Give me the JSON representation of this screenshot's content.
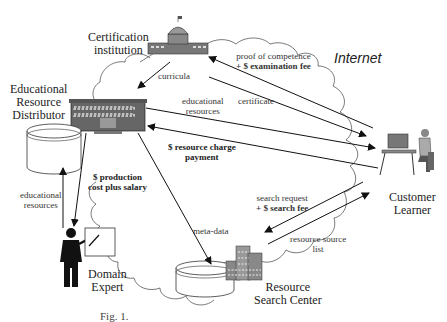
{
  "cloud_label": "Internet",
  "nodes": {
    "certification": {
      "line1": "Certification",
      "line2": "institution"
    },
    "distributor": {
      "line1": "Educational",
      "line2": "Resource",
      "line3": "Distributor"
    },
    "expert": {
      "line1": "Domain",
      "line2": "Expert"
    },
    "search_center": {
      "line1": "Resource",
      "line2": "Search Center"
    },
    "customer": {
      "line1": "Customer",
      "line2": "Learner"
    }
  },
  "edges": {
    "curricula": "curricula",
    "proof_line1": "proof of competence",
    "proof_line2": "+ $ examination fee",
    "certificate": "certificate",
    "edu_res_1": "educational",
    "edu_res_2": "resources",
    "charge_1": "$ resource charge",
    "charge_2": "payment",
    "prod_1": "$ production",
    "prod_2": "cost plus salary",
    "left_edu_1": "educational",
    "left_edu_2": "resources",
    "meta": "meta-data",
    "search_1": "search request",
    "search_2": "+ $ search fee",
    "list_1": "resource source",
    "list_2": "list"
  },
  "caption": "Fig. 1."
}
